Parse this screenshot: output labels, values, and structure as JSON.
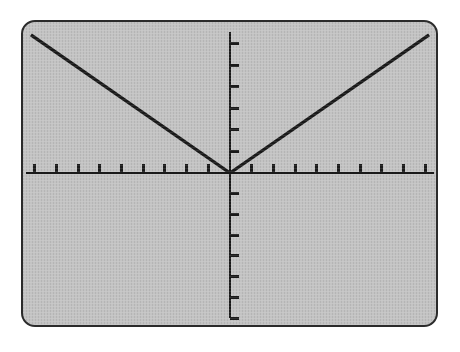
{
  "device": {
    "name": "graphing-calculator-screen",
    "screen": {
      "background_color": "#c3c3c3",
      "border_color": "#2b2b2b",
      "corner_radius_px": 14,
      "rect": {
        "x": 21,
        "y": 20,
        "width": 417,
        "height": 307
      }
    },
    "page_background_color": "#ffffff"
  },
  "chart_data": {
    "type": "line",
    "title": "",
    "subtitle": "",
    "xlabel": "",
    "ylabel": "",
    "function_label": "y = |x|",
    "grid": false,
    "legend": null,
    "legend_position": "none",
    "axes": {
      "x_axis": {
        "visible": true,
        "color": "#1a1a1a",
        "line_width_px": 3,
        "range": [
          -9,
          9
        ],
        "tick_interval": 1,
        "tick_count_left_of_origin": 9,
        "tick_count_right_of_origin": 9,
        "tick_labels_visible": false,
        "tick_length_px": 9,
        "pixel_y": 173,
        "pixel_x_start": 24,
        "pixel_x_end": 436
      },
      "y_axis": {
        "visible": true,
        "color": "#1a1a1a",
        "line_width_px": 3,
        "range": [
          -6.7,
          6.6
        ],
        "tick_interval": 1,
        "tick_count_above_origin": 6,
        "tick_count_below_origin": 6,
        "tick_labels_visible": false,
        "tick_length_px": 9,
        "pixel_x": 230,
        "pixel_y_start": 30,
        "pixel_y_end": 320
      },
      "origin_pixel": {
        "x": 230,
        "y": 173
      }
    },
    "series": [
      {
        "name": "y = |x|",
        "color": "#1a1a1a",
        "line_width_px": 3.4,
        "shape": "v",
        "vertex": {
          "x": 0,
          "y": 0
        },
        "slope_left": -1,
        "slope_right": 1,
        "x": [
          -9,
          0,
          9
        ],
        "values": [
          6.2,
          0,
          6.2
        ],
        "pixel_points": [
          {
            "x": 29,
            "y": 33
          },
          {
            "x": 230,
            "y": 173
          },
          {
            "x": 431,
            "y": 33
          }
        ]
      }
    ],
    "annotations": []
  }
}
